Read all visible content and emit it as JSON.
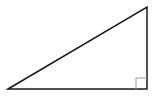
{
  "figure": {
    "name": "right-triangle",
    "canvas": {
      "width": 159,
      "height": 97,
      "background_color": "#ffffff"
    },
    "triangle": {
      "fill": "none",
      "stroke_color": "#1a1a1a",
      "stroke_width": 1.5,
      "vertices": [
        {
          "name": "bottom-left",
          "x": 8,
          "y": 89,
          "angle_type": "acute"
        },
        {
          "name": "top-right",
          "x": 147,
          "y": 7,
          "angle_type": "acute"
        },
        {
          "name": "bottom-right",
          "x": 147,
          "y": 89,
          "angle_type": "right"
        }
      ],
      "points_attr": "8,89 147,7 147,89",
      "sides": [
        {
          "name": "base",
          "from": "bottom-left",
          "to": "bottom-right",
          "orientation": "horizontal",
          "length_px": 139
        },
        {
          "name": "vertical-leg",
          "from": "bottom-right",
          "to": "top-right",
          "orientation": "vertical",
          "length_px": 82
        },
        {
          "name": "hypotenuse",
          "from": "bottom-left",
          "to": "top-right",
          "orientation": "diagonal",
          "length_px": 161
        }
      ]
    },
    "right_angle_marker": {
      "name": "right-angle-square",
      "at_vertex": "bottom-right",
      "size_px": 11,
      "x": 136,
      "y": 78,
      "fill": "none",
      "stroke_color": "#9a9a9a",
      "stroke_width": 1,
      "path_attr": "M 136 78 L 136 89 M 136 78 L 147 78"
    },
    "labels": [],
    "text_annotations": []
  }
}
